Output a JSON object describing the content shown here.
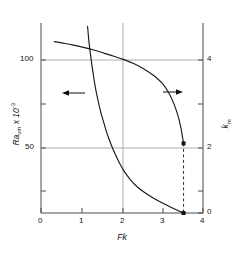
{
  "chart_data": {
    "type": "line",
    "title": "",
    "xlabel": "Fk",
    "ylabel_left": "Ra",
    "ylabel_left_sub": "vm",
    "ylabel_left_tail": " x 10",
    "ylabel_left_exp": "-3",
    "ylabel_right": "k",
    "ylabel_right_sub": "m",
    "xlim": [
      0,
      4
    ],
    "xticks": [
      0,
      1,
      2,
      3,
      4
    ],
    "xticklabels": [
      "0",
      "1",
      "2",
      "3",
      "4"
    ],
    "ylim_left": [
      0,
      120
    ],
    "yticks_left": [
      0,
      25,
      50,
      75,
      100
    ],
    "yticklabels_left": [
      "",
      "",
      "50",
      "",
      "100"
    ],
    "ylim_right": [
      0,
      5.45
    ],
    "yticks_right": [
      0,
      1,
      2,
      3,
      4
    ],
    "yticklabels_right": [
      "0",
      "",
      "2",
      "",
      "4"
    ],
    "grid": "gridlines at Ra=100 and Ra=50 (k=4 and k=2), and at Fk=2",
    "legend_position": "none",
    "annotations": [
      {
        "name": "left-arrow",
        "text": "←",
        "x": 1.35,
        "y": 74,
        "points_to": "left-axis"
      },
      {
        "name": "right-arrow",
        "text": "→",
        "x": 3.05,
        "y": 74,
        "points_to": "right-axis"
      }
    ],
    "series": [
      {
        "name": "Ra_vm (left axis)",
        "axis": "left",
        "style": "solid",
        "points": [
          [
            1.15,
            122.0
          ],
          [
            1.18,
            113.0
          ],
          [
            1.22,
            104.0
          ],
          [
            1.26,
            96.0
          ],
          [
            1.3,
            89.0
          ],
          [
            1.34,
            82.5
          ],
          [
            1.38,
            77.0
          ],
          [
            1.43,
            71.0
          ],
          [
            1.48,
            65.5
          ],
          [
            1.54,
            60.0
          ],
          [
            1.6,
            54.5
          ],
          [
            1.67,
            49.0
          ],
          [
            1.75,
            43.5
          ],
          [
            1.84,
            38.0
          ],
          [
            1.94,
            32.5
          ],
          [
            2.06,
            27.0
          ],
          [
            2.2,
            22.0
          ],
          [
            2.36,
            17.5
          ],
          [
            2.55,
            13.5
          ],
          [
            2.76,
            10.0
          ],
          [
            3.0,
            6.5
          ],
          [
            3.22,
            3.6
          ],
          [
            3.42,
            1.2
          ],
          [
            3.52,
            0.0
          ]
        ],
        "endpoint_marker": {
          "x": 3.52,
          "y": 0.0,
          "style": "filled-square"
        }
      },
      {
        "name": "k_m (right axis)",
        "axis": "right",
        "style": "solid",
        "points": [
          [
            0.33,
            4.48
          ],
          [
            0.55,
            4.44
          ],
          [
            0.8,
            4.39
          ],
          [
            1.05,
            4.33
          ],
          [
            1.3,
            4.26
          ],
          [
            1.55,
            4.18
          ],
          [
            1.8,
            4.1
          ],
          [
            2.05,
            4.01
          ],
          [
            2.3,
            3.9
          ],
          [
            2.55,
            3.76
          ],
          [
            2.8,
            3.58
          ],
          [
            3.0,
            3.38
          ],
          [
            3.15,
            3.15
          ],
          [
            3.28,
            2.86
          ],
          [
            3.38,
            2.55
          ],
          [
            3.45,
            2.25
          ],
          [
            3.5,
            1.95
          ],
          [
            3.52,
            1.82
          ]
        ],
        "endpoint_marker": {
          "x": 3.52,
          "y": 1.82,
          "style": "filled-square"
        }
      }
    ],
    "dashed_line": {
      "name": "critical-Fk-dropline",
      "x": 3.52,
      "y_from": 1.82,
      "y_to": 0.0,
      "style": "dashed"
    },
    "colors": {
      "curve": "#1a1a1a",
      "grid": "#9a9a9a",
      "axis": "#4a4a4a",
      "text": "#111111",
      "background": "#ffffff"
    }
  }
}
